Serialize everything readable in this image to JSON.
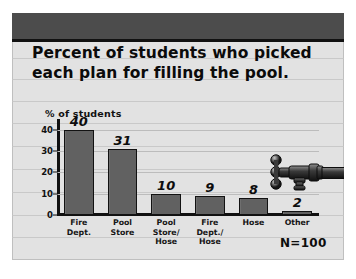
{
  "poster": {
    "title_line1": "Percent of students who picked",
    "title_line2": "each plan for filling the pool.",
    "sample_note": "N=100",
    "decoration_icon": "faucet-spigot-icon",
    "colors": {
      "poster_background": "#e2e2e2",
      "header_band": "#4c4c4c",
      "bar_fill": "#616161",
      "bar_outline": "#121212",
      "axis": "#111111",
      "gridline": "#c4c4c4",
      "text": "#0b0b0b"
    }
  },
  "chart_data": {
    "type": "bar",
    "title": "Percent of students who picked each plan for filling the pool.",
    "xlabel": "",
    "ylabel": "% of students",
    "categories": [
      "Fire\nDept.",
      "Pool\nStore",
      "Pool\nStore/\nHose",
      "Fire\nDept./\nHose",
      "Hose",
      "Other"
    ],
    "values": [
      40,
      31,
      10,
      9,
      8,
      2
    ],
    "data_labels": [
      "40",
      "31",
      "10",
      "9",
      "8",
      "2"
    ],
    "yticks": [
      0,
      10,
      20,
      30,
      40
    ],
    "ytick_labels": [
      "0",
      "10",
      "20",
      "30",
      "40"
    ],
    "ylim": [
      0,
      44
    ],
    "grid": true,
    "legend": false,
    "annotation": "N=100"
  }
}
